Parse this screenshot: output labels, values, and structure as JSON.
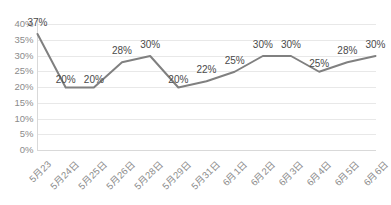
{
  "chart_data": {
    "type": "line",
    "title": "",
    "subtitle": "",
    "xlabel": "",
    "ylabel": "",
    "grid": true,
    "legend": "none",
    "ylim": [
      0,
      40
    ],
    "ytick_step": 5,
    "ytick_labels": [
      "40%",
      "35%",
      "30%",
      "25%",
      "20%",
      "15%",
      "10%",
      "5%",
      "0%"
    ],
    "ytick_values": [
      40,
      35,
      30,
      25,
      20,
      15,
      10,
      5,
      0
    ],
    "categories": [
      "5月23",
      "5月24日",
      "5月25日",
      "5月26日",
      "5月28日",
      "5月29日",
      "5月31日",
      "6月1日",
      "6月2日",
      "6月3日",
      "6月4日",
      "6月5日",
      "6月6日"
    ],
    "values": [
      37,
      20,
      20,
      28,
      30,
      20,
      22,
      25,
      30,
      30,
      25,
      28,
      30
    ],
    "data_labels": [
      "37%",
      "20%",
      "20%",
      "28%",
      "30%",
      "20%",
      "22%",
      "25%",
      "30%",
      "30%",
      "25%",
      "28%",
      "30%"
    ],
    "series": [
      {
        "name": "",
        "values": [
          37,
          20,
          20,
          28,
          30,
          20,
          22,
          25,
          30,
          30,
          25,
          28,
          30
        ],
        "color": "#808080"
      }
    ]
  },
  "colors": {
    "line": "#808080",
    "grid": "#e8e8e8",
    "axis": "#d9d9d9",
    "tick_text": "#8b8b8b",
    "data_label_text": "#4a4a4a",
    "background": "#ffffff"
  }
}
